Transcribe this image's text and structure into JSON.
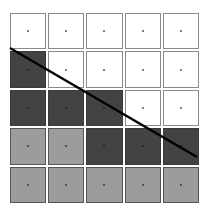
{
  "diagram": {
    "rows": 5,
    "cols": 5,
    "colors": {
      "white": "#ffffff",
      "dark": "#434343",
      "light": "#9c9c9c",
      "line": "#000000"
    },
    "cells": [
      [
        "white",
        "white",
        "white",
        "white",
        "white"
      ],
      [
        "dark",
        "white",
        "white",
        "white",
        "white"
      ],
      [
        "dark",
        "dark",
        "dark",
        "white",
        "white"
      ],
      [
        "light",
        "light",
        "dark",
        "dark",
        "dark"
      ],
      [
        "light",
        "light",
        "light",
        "light",
        "light"
      ]
    ],
    "line": {
      "x1": 10,
      "y1": 48,
      "x2": 197,
      "y2": 157
    }
  }
}
